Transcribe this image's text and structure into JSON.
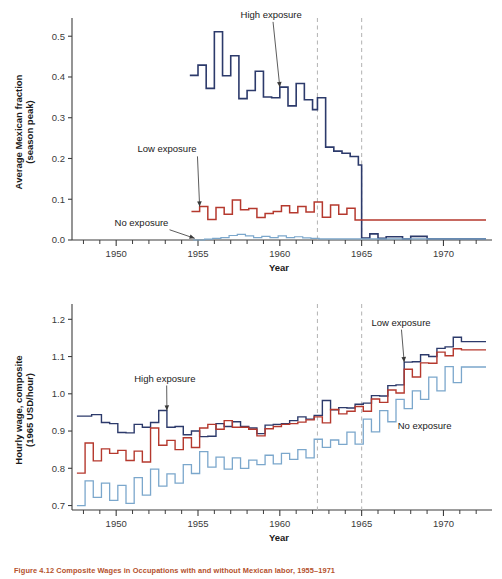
{
  "figure": {
    "caption": "Figure 4.12  Composite Wages in Occupations with and without Mexican labor, 1955–1971"
  },
  "chart_data": [
    {
      "id": "top",
      "type": "line",
      "line_style": "step",
      "title": "",
      "xlabel": "Year",
      "ylabel": "Average Mexican fraction (season peak)",
      "ylabel_line1": "Average Mexican fraction",
      "ylabel_line2": "(season peak)",
      "xlim": [
        1947.3,
        1972.6
      ],
      "ylim": [
        0.0,
        0.53
      ],
      "xticks_major": [
        1950,
        1955,
        1960,
        1965,
        1970
      ],
      "xticklabels": [
        "1950",
        "1955",
        "1960",
        "1965",
        "1970"
      ],
      "xticks_minor": [
        1948,
        1949,
        1951,
        1952,
        1953,
        1954,
        1956,
        1957,
        1958,
        1959,
        1961,
        1962,
        1963,
        1964,
        1966,
        1967,
        1968,
        1969,
        1971,
        1972
      ],
      "yticks": [
        0.0,
        0.1,
        0.2,
        0.3,
        0.4,
        0.5
      ],
      "yticklabels": [
        "0.0",
        "0.1",
        "0.2",
        "0.3",
        "0.4",
        "0.5"
      ],
      "grid": false,
      "vlines": [
        1962.3,
        1965.0
      ],
      "annotations": [
        {
          "label": "High exposure",
          "text_x": 1957.6,
          "text_y": 0.545,
          "point_x": 1960.0,
          "point_y": 0.375
        },
        {
          "label": "Low exposure",
          "text_x": 1951.3,
          "text_y": 0.215,
          "point_x": 1955.1,
          "point_y": 0.082
        },
        {
          "label": "No exposure",
          "text_x": 1949.9,
          "text_y": 0.035,
          "point_x": 1954.8,
          "point_y": 0.004
        }
      ],
      "series": [
        {
          "name": "High exposure",
          "color": "#2c3a6b",
          "width": 1.6,
          "x": [
            1954.5,
            1955,
            1955.5,
            1956,
            1956.5,
            1957,
            1957.5,
            1958,
            1958.5,
            1959,
            1959.5,
            1960,
            1960.5,
            1961,
            1961.5,
            1962,
            1962.3,
            1962.8,
            1963.3,
            1963.8,
            1964.3,
            1964.8,
            1965,
            1965.5,
            1966,
            1966.5,
            1967,
            1967.5,
            1968,
            1969,
            1970,
            1971,
            1972.4
          ],
          "values": [
            0.404,
            0.429,
            0.372,
            0.511,
            0.403,
            0.452,
            0.347,
            0.367,
            0.414,
            0.351,
            0.349,
            0.375,
            0.329,
            0.384,
            0.344,
            0.32,
            0.349,
            0.228,
            0.218,
            0.213,
            0.205,
            0.184,
            0.005,
            0.015,
            0.004,
            0.008,
            0.008,
            0.003,
            0.009,
            0.003,
            0.003,
            0.003,
            0.003
          ]
        },
        {
          "name": "Low exposure",
          "color": "#b5392e",
          "width": 1.5,
          "x": [
            1954.6,
            1955.1,
            1955.6,
            1956.1,
            1956.6,
            1957.1,
            1957.6,
            1958.1,
            1958.6,
            1959.1,
            1959.6,
            1960.1,
            1960.6,
            1961.1,
            1961.6,
            1962.1,
            1962.6,
            1963.1,
            1963.6,
            1964.1,
            1964.6,
            1965.0
          ],
          "values": [
            0.07,
            0.082,
            0.05,
            0.08,
            0.063,
            0.098,
            0.074,
            0.077,
            0.055,
            0.065,
            0.07,
            0.084,
            0.067,
            0.082,
            0.069,
            0.093,
            0.056,
            0.086,
            0.063,
            0.078,
            0.049,
            0.049
          ]
        },
        {
          "name": "No exposure",
          "color": "#7ba7cc",
          "width": 1.2,
          "x": [
            1954.7,
            1955.4,
            1955.9,
            1956.4,
            1956.9,
            1957.4,
            1957.9,
            1958.4,
            1958.9,
            1959.4,
            1959.9,
            1960.4,
            1960.9,
            1961.4,
            1961.9,
            1962.4,
            1963,
            1964,
            1965,
            1966,
            1968,
            1970,
            1972.4
          ],
          "values": [
            0.0,
            0.002,
            0.004,
            0.006,
            0.011,
            0.014,
            0.01,
            0.006,
            0.009,
            0.006,
            0.01,
            0.006,
            0.008,
            0.005,
            0.004,
            0.003,
            0.003,
            0.003,
            0.003,
            0.003,
            0.003,
            0.003,
            0.003
          ]
        }
      ]
    },
    {
      "id": "bottom",
      "type": "line",
      "line_style": "step",
      "title": "",
      "xlabel": "Year",
      "ylabel": "Hourly wage, composite (1965 USD/hour)",
      "ylabel_line1": "Hourly wage, composite",
      "ylabel_line2": "(1965 USD/hour)",
      "xlim": [
        1947.3,
        1972.6
      ],
      "ylim": [
        0.688,
        1.225
      ],
      "xticks_major": [
        1950,
        1955,
        1960,
        1965,
        1970
      ],
      "xticklabels": [
        "1950",
        "1955",
        "1960",
        "1965",
        "1970"
      ],
      "xticks_minor": [
        1948,
        1949,
        1951,
        1952,
        1953,
        1954,
        1956,
        1957,
        1958,
        1959,
        1961,
        1962,
        1963,
        1964,
        1966,
        1967,
        1968,
        1969,
        1971,
        1972
      ],
      "yticks": [
        0.7,
        0.8,
        0.9,
        1.0,
        1.1,
        1.2
      ],
      "yticklabels": [
        "0.7",
        "0.8",
        "0.9",
        "1.0",
        "1.1",
        "1.2"
      ],
      "grid": false,
      "vlines": [
        1962.3,
        1965.0
      ],
      "annotations": [
        {
          "label": "High exposure",
          "text_x": 1951.1,
          "text_y": 1.033,
          "point_x": 1953.1,
          "point_y": 0.955
        },
        {
          "label": "Low exposure",
          "text_x": 1965.6,
          "text_y": 1.183,
          "point_x": 1967.6,
          "point_y": 1.085
        },
        {
          "label": "No exposure",
          "text_x": 1967.2,
          "text_y": 0.905,
          "point_x": null,
          "point_y": null
        }
      ],
      "series": [
        {
          "name": "High exposure",
          "color": "#2c3a6b",
          "width": 1.4,
          "x": [
            1947.6,
            1948.5,
            1949.1,
            1949.6,
            1950.1,
            1950.6,
            1951.1,
            1951.6,
            1952.1,
            1952.6,
            1953.1,
            1953.6,
            1954.1,
            1954.6,
            1955.1,
            1955.6,
            1956.1,
            1956.6,
            1957.1,
            1957.6,
            1958.1,
            1958.6,
            1959.1,
            1959.6,
            1960.1,
            1960.6,
            1961.1,
            1961.6,
            1962.1,
            1962.6,
            1963.1,
            1963.6,
            1964.1,
            1964.6,
            1965.1,
            1965.6,
            1966.1,
            1966.6,
            1967.1,
            1967.6,
            1968.1,
            1968.6,
            1969.1,
            1969.6,
            1970.1,
            1970.6,
            1971.1
          ],
          "values": [
            0.94,
            0.944,
            0.923,
            0.92,
            0.896,
            0.895,
            0.918,
            0.91,
            0.923,
            0.955,
            0.91,
            0.912,
            0.89,
            0.9,
            0.885,
            0.886,
            0.92,
            0.912,
            0.925,
            0.912,
            0.908,
            0.893,
            0.916,
            0.918,
            0.92,
            0.928,
            0.938,
            0.932,
            0.942,
            0.982,
            0.957,
            0.963,
            0.962,
            0.972,
            0.975,
            0.995,
            0.994,
            1.022,
            1.024,
            1.085,
            1.086,
            1.105,
            1.1,
            1.122,
            1.126,
            1.152,
            1.14
          ]
        },
        {
          "name": "Low exposure",
          "color": "#b5392e",
          "width": 1.4,
          "x": [
            1947.6,
            1948.1,
            1948.6,
            1949.1,
            1949.6,
            1950.1,
            1950.6,
            1951.1,
            1951.6,
            1952.1,
            1952.6,
            1953.1,
            1953.6,
            1954.1,
            1954.6,
            1955.1,
            1955.6,
            1956.1,
            1956.6,
            1957.1,
            1957.6,
            1958.1,
            1958.6,
            1959.1,
            1959.6,
            1960.1,
            1960.6,
            1961.1,
            1961.6,
            1962.1,
            1962.6,
            1963.1,
            1963.6,
            1964.1,
            1964.6,
            1965.1,
            1965.6,
            1966.1,
            1966.6,
            1967.1,
            1967.6,
            1968.1,
            1968.6,
            1969.1,
            1969.6,
            1970.1,
            1970.6,
            1971.1
          ],
          "values": [
            0.787,
            0.868,
            0.82,
            0.852,
            0.84,
            0.848,
            0.821,
            0.846,
            0.817,
            0.908,
            0.862,
            0.875,
            0.85,
            0.882,
            0.856,
            0.908,
            0.918,
            0.905,
            0.928,
            0.91,
            0.91,
            0.905,
            0.887,
            0.906,
            0.912,
            0.918,
            0.92,
            0.924,
            0.93,
            0.938,
            0.922,
            0.958,
            0.946,
            0.953,
            0.966,
            0.953,
            0.986,
            0.977,
            1.01,
            1.002,
            1.066,
            1.045,
            1.083,
            1.082,
            1.112,
            1.102,
            1.121,
            1.118
          ]
        },
        {
          "name": "No exposure",
          "color": "#7ba7cc",
          "width": 1.3,
          "x": [
            1947.6,
            1948.1,
            1948.6,
            1949.1,
            1949.6,
            1950.1,
            1950.6,
            1951.1,
            1951.6,
            1952.1,
            1952.6,
            1953.1,
            1953.6,
            1954.1,
            1954.6,
            1955.1,
            1955.6,
            1956.1,
            1956.6,
            1957.1,
            1957.6,
            1958.1,
            1958.6,
            1959.1,
            1959.6,
            1960.1,
            1960.6,
            1961.1,
            1961.6,
            1962.1,
            1962.6,
            1963.1,
            1963.6,
            1964.1,
            1964.6,
            1965.1,
            1965.6,
            1966.1,
            1966.6,
            1967.1,
            1967.6,
            1968.1,
            1968.6,
            1969.1,
            1969.6,
            1970.1,
            1970.6,
            1971.1
          ],
          "values": [
            0.7,
            0.766,
            0.722,
            0.76,
            0.714,
            0.754,
            0.706,
            0.775,
            0.728,
            0.798,
            0.752,
            0.785,
            0.76,
            0.81,
            0.786,
            0.845,
            0.803,
            0.83,
            0.798,
            0.828,
            0.8,
            0.822,
            0.81,
            0.835,
            0.812,
            0.84,
            0.824,
            0.85,
            0.828,
            0.878,
            0.856,
            0.876,
            0.864,
            0.897,
            0.865,
            0.932,
            0.898,
            0.955,
            0.925,
            0.985,
            0.96,
            1.008,
            0.985,
            1.045,
            1.008,
            1.073,
            1.03,
            1.072
          ]
        }
      ]
    }
  ]
}
